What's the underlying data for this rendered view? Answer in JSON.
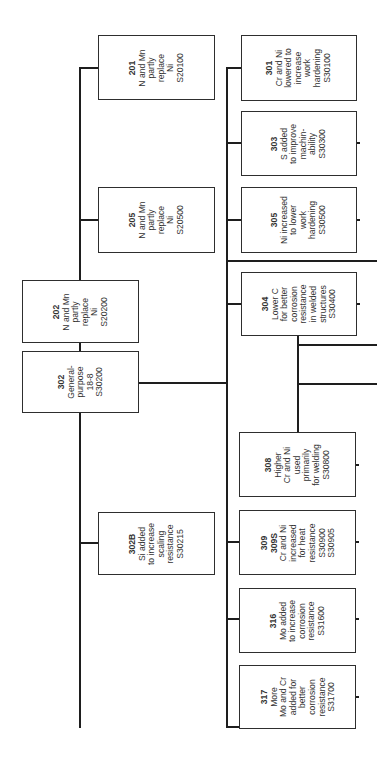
{
  "diagram": {
    "root": "302",
    "colors": {
      "line": "#1e1e1e",
      "box_border": "#2e2e2e",
      "text": "#333333",
      "background": "#ffffff"
    },
    "nodes": {
      "n201": {
        "code": "201",
        "lines": [
          "N and Mn",
          "partly",
          "replace",
          "Ni",
          "S20100"
        ]
      },
      "n205": {
        "code": "205",
        "lines": [
          "N and Mn",
          "partly",
          "replace",
          "Ni",
          "S20500"
        ]
      },
      "n202": {
        "code": "202",
        "lines": [
          "N and Mn",
          "partly",
          "replace",
          "Ni",
          "S20200"
        ]
      },
      "n302": {
        "code": "302",
        "lines": [
          "General-",
          "purpose",
          "18-8",
          "S30200"
        ]
      },
      "n302B": {
        "code": "302B",
        "lines": [
          "Si added",
          "to increase",
          "scaling",
          "resistance",
          "S30215"
        ]
      },
      "n301": {
        "code": "301",
        "lines": [
          "Cr and Ni",
          "lowered to",
          "increase",
          "work",
          "hardening",
          "S30100"
        ]
      },
      "n303": {
        "code": "303",
        "lines": [
          "S added",
          "to improve",
          "machin-",
          "ability",
          "S30300"
        ]
      },
      "n305": {
        "code": "305",
        "lines": [
          "Ni increased",
          "to lower",
          "work",
          "hardening",
          "S30500"
        ]
      },
      "n304": {
        "code": "304",
        "lines": [
          "Lower C",
          "for better",
          "corrosion",
          "resistance",
          "in welded",
          "structures",
          "S30400"
        ]
      },
      "n308": {
        "code": "308",
        "lines": [
          "Higher",
          "Cr and Ni",
          "used",
          "primarily",
          "for welding",
          "S30800"
        ]
      },
      "n309": {
        "code": "309",
        "code2": "309S",
        "lines": [
          "Cr and Ni",
          "increased",
          "for heat",
          "resistance",
          "S30900",
          "S30905"
        ]
      },
      "n316": {
        "code": "316",
        "lines": [
          "Mo added",
          "to increase",
          "corrosion",
          "resistance",
          "S31600"
        ]
      },
      "n317": {
        "code": "317",
        "lines": [
          "More",
          "Mo and Cr",
          "added for",
          "better",
          "corrosion",
          "resistance",
          "S31700"
        ]
      }
    },
    "edges": [
      [
        "302",
        "201"
      ],
      [
        "302",
        "205"
      ],
      [
        "302",
        "202"
      ],
      [
        "302",
        "302B"
      ],
      [
        "302",
        "301"
      ],
      [
        "302",
        "303"
      ],
      [
        "302",
        "305"
      ],
      [
        "302",
        "304"
      ],
      [
        "302",
        "308"
      ],
      [
        "302",
        "309"
      ],
      [
        "302",
        "316"
      ],
      [
        "302",
        "317"
      ]
    ]
  }
}
